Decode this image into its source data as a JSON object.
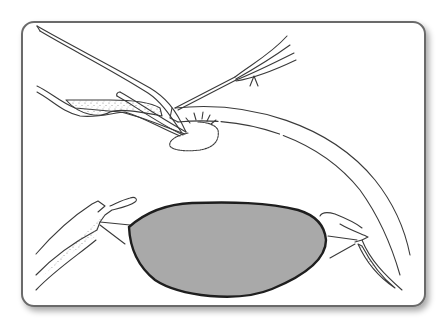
{
  "figure": {
    "colors": {
      "background": "#ffffff",
      "frame_border": "#6b6b6b",
      "frame_shadow": "#c8c8c8",
      "line_art": "#3a3a3a",
      "lens_fill": "#a9a9a9",
      "lens_outline": "#1e1e1e",
      "stipple": "#8a8a8a"
    },
    "elements": [
      "frame",
      "cornea",
      "forceps",
      "cannula",
      "needle-instrument",
      "tissue-flap",
      "lens",
      "left-iris",
      "right-iris"
    ]
  }
}
